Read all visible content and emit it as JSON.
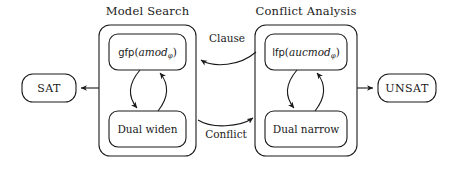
{
  "diagram": {
    "stroke_color": "#1a1a1a",
    "background_color": "#ffffff"
  },
  "groups": [
    {
      "id": "model-search",
      "title": "Model Search",
      "nodes": [
        {
          "id": "gfp-amod",
          "kind": "formula",
          "function": "gfp",
          "open_paren": "(",
          "argument": "amod",
          "subscript": "φ",
          "close_paren": ")",
          "plain": "gfp(amodφ)"
        },
        {
          "id": "dual-widen",
          "kind": "text",
          "label": "Dual widen"
        }
      ]
    },
    {
      "id": "conflict-analysis",
      "title": "Conflict Analysis",
      "nodes": [
        {
          "id": "lfp-aucmod",
          "kind": "formula",
          "function": "lfp",
          "open_paren": "(",
          "argument": "aucmod",
          "subscript": "φ",
          "close_paren": ")",
          "plain": "lfp(aucmodφ)"
        },
        {
          "id": "dual-narrow",
          "kind": "text",
          "label": "Dual narrow"
        }
      ]
    }
  ],
  "terminals": [
    {
      "id": "sat",
      "label": "SAT"
    },
    {
      "id": "unsat",
      "label": "UNSAT"
    }
  ],
  "edge_labels": [
    {
      "id": "clause",
      "label": "Clause"
    },
    {
      "id": "conflict",
      "label": "Conflict"
    }
  ]
}
